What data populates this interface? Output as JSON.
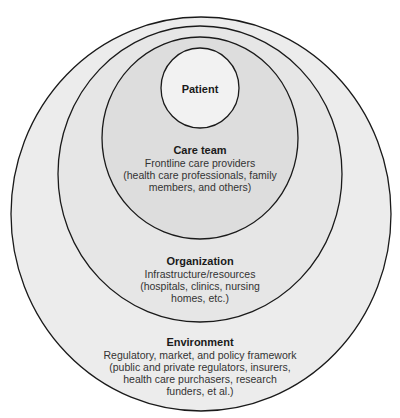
{
  "diagram": {
    "type": "nested-circles",
    "colors": {
      "background": "#ffffff",
      "environment_fill": "#ececec",
      "organization_fill": "#e6e6e6",
      "care_team_fill": "#dddddd",
      "patient_fill": "#f2f2f2",
      "stroke": "#1a1a1a"
    },
    "layers": {
      "patient": {
        "title": "Patient"
      },
      "care_team": {
        "title": "Care team",
        "lines": [
          "Frontline care providers",
          "(health care professionals, family",
          "members, and others)"
        ]
      },
      "organization": {
        "title": "Organization",
        "lines": [
          "Infrastructure/resources",
          "(hospitals, clinics, nursing",
          "homes, etc.)"
        ]
      },
      "environment": {
        "title": "Environment",
        "lines": [
          "Regulatory, market, and policy framework",
          "(public and private regulators, insurers,",
          "health care purchasers, research",
          "funders, et al.)"
        ]
      }
    }
  }
}
